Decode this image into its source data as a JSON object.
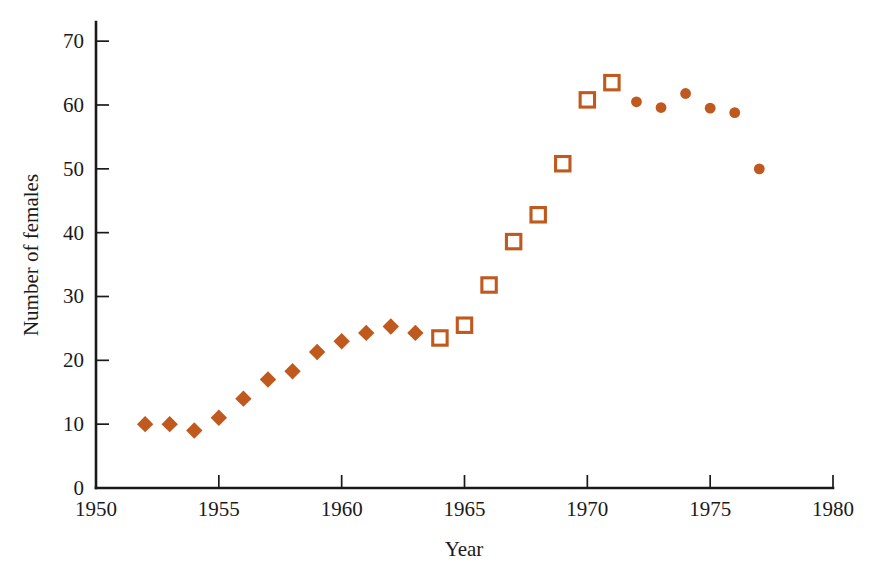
{
  "chart_data": {
    "type": "scatter",
    "title": "",
    "xlabel": "Year",
    "ylabel": "Number of females",
    "xlim": [
      1950,
      1980
    ],
    "ylim": [
      0,
      73
    ],
    "xticks": [
      1950,
      1955,
      1960,
      1965,
      1970,
      1975,
      1980
    ],
    "xticklabels": [
      "1950",
      "1955",
      "1960",
      "1965",
      "1970",
      "1975",
      "1980"
    ],
    "yticks": [
      0,
      10,
      20,
      30,
      40,
      50,
      60,
      70
    ],
    "yticklabels": [
      "0",
      "10",
      "20",
      "30",
      "40",
      "50",
      "60",
      "70"
    ],
    "grid": false,
    "legend": "none",
    "marker_color": "#C0591E",
    "axis_color": "#1a1a1a",
    "background": "#ffffff",
    "series": [
      {
        "name": "Filled diamond period",
        "marker": "diamond-filled",
        "color": "#C0591E",
        "points": [
          {
            "x": 1952,
            "y": 10.0
          },
          {
            "x": 1953,
            "y": 10.0
          },
          {
            "x": 1954,
            "y": 9.0
          },
          {
            "x": 1955,
            "y": 11.0
          },
          {
            "x": 1956,
            "y": 14.0
          },
          {
            "x": 1957,
            "y": 17.0
          },
          {
            "x": 1958,
            "y": 18.3
          },
          {
            "x": 1959,
            "y": 21.3
          },
          {
            "x": 1960,
            "y": 23.0
          },
          {
            "x": 1961,
            "y": 24.3
          },
          {
            "x": 1962,
            "y": 25.3
          },
          {
            "x": 1963,
            "y": 24.3
          }
        ]
      },
      {
        "name": "Open square period",
        "marker": "square-open",
        "color": "#C0591E",
        "points": [
          {
            "x": 1964,
            "y": 23.5
          },
          {
            "x": 1965,
            "y": 25.5
          },
          {
            "x": 1966,
            "y": 31.8
          },
          {
            "x": 1967,
            "y": 38.6
          },
          {
            "x": 1968,
            "y": 42.8
          },
          {
            "x": 1969,
            "y": 50.8
          },
          {
            "x": 1970,
            "y": 60.8
          },
          {
            "x": 1971,
            "y": 63.5
          }
        ]
      },
      {
        "name": "Filled circle period",
        "marker": "circle-filled",
        "color": "#C0591E",
        "points": [
          {
            "x": 1972,
            "y": 60.5
          },
          {
            "x": 1973,
            "y": 59.6
          },
          {
            "x": 1974,
            "y": 61.8
          },
          {
            "x": 1975,
            "y": 59.5
          },
          {
            "x": 1976,
            "y": 58.8
          },
          {
            "x": 1977,
            "y": 50.0
          }
        ]
      }
    ]
  }
}
